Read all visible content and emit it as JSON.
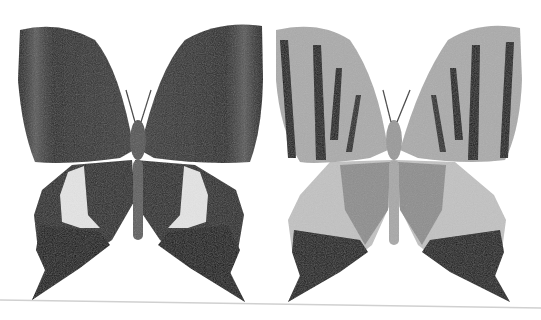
{
  "image": {
    "description": "Two mounted swallowtail butterfly specimens in grayscale, side by side: left shows dark upperside (dorsal), right shows lighter underside (ventral) with dark stripes on forewings",
    "background": "#ffffff",
    "specimens": [
      {
        "label": "dorsal",
        "forewing": "#2e2e2e",
        "forewing_edge": "#1a1a1a",
        "hindwing_band": "#e2e2e2",
        "tail": "#111111",
        "body": "#555555"
      },
      {
        "label": "ventral",
        "forewing": "#a9a9a9",
        "stripe": "#1e1e1e",
        "hindwing": "#bdbdbd",
        "hindwing_inner": "#8f8f8f",
        "tail": "#161616",
        "body": "#9a9a9a"
      }
    ],
    "baseline_color": "#d0d0d0"
  }
}
